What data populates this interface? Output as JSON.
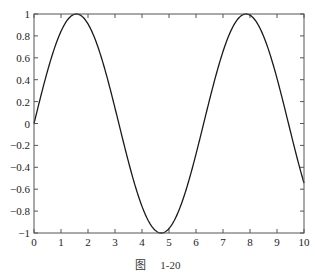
{
  "chart_data": {
    "type": "line",
    "title": "",
    "xlabel": "",
    "ylabel": "",
    "xlim": [
      0,
      10
    ],
    "ylim": [
      -1,
      1
    ],
    "grid": false,
    "legend": null,
    "function": "y = sin(x)",
    "x_ticks": [
      0,
      1,
      2,
      3,
      4,
      5,
      6,
      7,
      8,
      9,
      10
    ],
    "x_tick_labels": [
      "0",
      "1",
      "2",
      "3",
      "4",
      "5",
      "6",
      "7",
      "8",
      "9",
      "10"
    ],
    "y_ticks": [
      1,
      0.8,
      0.6,
      0.4,
      0.2,
      0,
      -0.2,
      -0.4,
      -0.6,
      -0.8,
      -1
    ],
    "y_tick_labels": [
      "1",
      "0.8",
      "0.6",
      "0.4",
      "0.2",
      "0",
      "−0.2",
      "−0.4",
      "−0.6",
      "−0.8",
      "−1"
    ],
    "series": [
      {
        "name": "sin(x)",
        "color": "#1a1a1a",
        "x": [
          0,
          0.5,
          1,
          1.5,
          1.571,
          2,
          2.5,
          3,
          3.5,
          4,
          4.5,
          4.712,
          5,
          5.5,
          6,
          6.5,
          7,
          7.5,
          7.854,
          8,
          8.5,
          9,
          9.5,
          10
        ],
        "values": [
          0,
          0.479,
          0.841,
          0.997,
          1,
          0.909,
          0.598,
          0.141,
          -0.351,
          -0.757,
          -0.978,
          -1,
          -0.959,
          -0.706,
          -0.279,
          0.215,
          0.657,
          0.938,
          1,
          0.989,
          0.798,
          0.412,
          -0.075,
          -0.544
        ]
      }
    ]
  },
  "caption": {
    "prefix": "图",
    "number": "1-20"
  }
}
